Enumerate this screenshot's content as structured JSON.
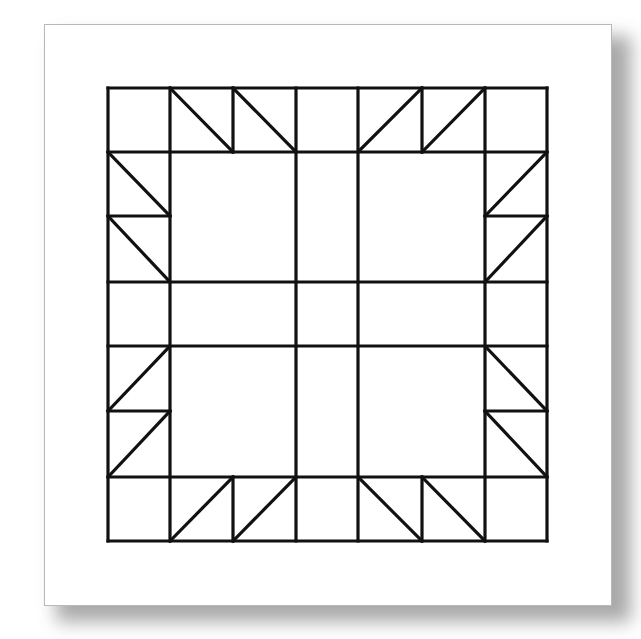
{
  "colors": {
    "line": "#111111",
    "paper": "#ffffff",
    "shadow": "#9a9a9a",
    "border": "#b8b8b8"
  },
  "stroke_width": 3.2,
  "block": {
    "x1": 108,
    "y1": 88,
    "x2": 547,
    "y2": 541
  },
  "grid": {
    "full_verticals": [
      108,
      170,
      296,
      358,
      485,
      547
    ],
    "full_horizontals": [
      88,
      152,
      282,
      346,
      477,
      541
    ]
  },
  "extra_segments": [
    {
      "x1": 233,
      "y1": 88,
      "x2": 233,
      "y2": 152
    },
    {
      "x1": 422,
      "y1": 88,
      "x2": 422,
      "y2": 152
    },
    {
      "x1": 233,
      "y1": 477,
      "x2": 233,
      "y2": 541
    },
    {
      "x1": 422,
      "y1": 477,
      "x2": 422,
      "y2": 541
    },
    {
      "x1": 108,
      "y1": 216,
      "x2": 170,
      "y2": 216
    },
    {
      "x1": 108,
      "y1": 411,
      "x2": 170,
      "y2": 411
    },
    {
      "x1": 485,
      "y1": 216,
      "x2": 547,
      "y2": 216
    },
    {
      "x1": 485,
      "y1": 411,
      "x2": 547,
      "y2": 411
    }
  ],
  "diagonals": [
    {
      "x1": 170,
      "y1": 88,
      "x2": 233,
      "y2": 152
    },
    {
      "x1": 233,
      "y1": 88,
      "x2": 296,
      "y2": 152
    },
    {
      "x1": 358,
      "y1": 152,
      "x2": 422,
      "y2": 88
    },
    {
      "x1": 422,
      "y1": 152,
      "x2": 485,
      "y2": 88
    },
    {
      "x1": 108,
      "y1": 152,
      "x2": 170,
      "y2": 216
    },
    {
      "x1": 108,
      "y1": 216,
      "x2": 170,
      "y2": 282
    },
    {
      "x1": 485,
      "y1": 216,
      "x2": 547,
      "y2": 152
    },
    {
      "x1": 485,
      "y1": 282,
      "x2": 547,
      "y2": 216
    },
    {
      "x1": 108,
      "y1": 411,
      "x2": 170,
      "y2": 346
    },
    {
      "x1": 108,
      "y1": 477,
      "x2": 170,
      "y2": 411
    },
    {
      "x1": 485,
      "y1": 346,
      "x2": 547,
      "y2": 411
    },
    {
      "x1": 485,
      "y1": 411,
      "x2": 547,
      "y2": 477
    },
    {
      "x1": 170,
      "y1": 541,
      "x2": 233,
      "y2": 477
    },
    {
      "x1": 233,
      "y1": 541,
      "x2": 296,
      "y2": 477
    },
    {
      "x1": 358,
      "y1": 477,
      "x2": 422,
      "y2": 541
    },
    {
      "x1": 422,
      "y1": 477,
      "x2": 485,
      "y2": 541
    }
  ]
}
